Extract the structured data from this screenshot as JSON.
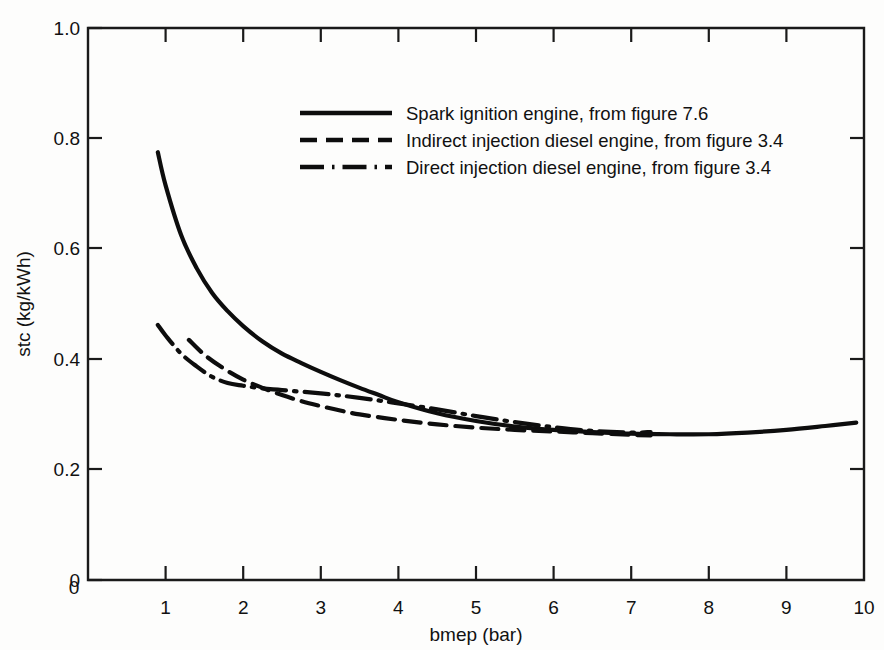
{
  "figure": {
    "background_color": "#fdfdfc",
    "line_color": "#0d0d0d"
  },
  "axes": {
    "x": {
      "label": "bmep (bar)",
      "ticks": [
        "0",
        "1",
        "2",
        "3",
        "4",
        "5",
        "6",
        "7",
        "8",
        "9",
        "10"
      ],
      "range": [
        0,
        10
      ]
    },
    "y": {
      "label": "stc (kg/kWh)",
      "ticks": [
        "0",
        "0.2",
        "0.4",
        "0.6",
        "0.8",
        "1.0"
      ],
      "range": [
        0,
        1.0
      ]
    }
  },
  "legend": {
    "entries": [
      {
        "label": "Spark ignition engine, from figure 7.6",
        "style": "solid"
      },
      {
        "label": "Indirect injection diesel engine, from figure 3.4",
        "style": "dashed"
      },
      {
        "label": "Direct injection diesel engine, from figure 3.4",
        "style": "dashdot"
      }
    ]
  },
  "chart_data": {
    "type": "line",
    "title": "",
    "xlabel": "bmep (bar)",
    "ylabel": "stc (kg/kWh)",
    "xlim": [
      0,
      10
    ],
    "ylim": [
      0,
      1.0
    ],
    "xticks": [
      0,
      1,
      2,
      3,
      4,
      5,
      6,
      7,
      8,
      9,
      10
    ],
    "yticks": [
      0,
      0.2,
      0.4,
      0.6,
      0.8,
      1.0
    ],
    "grid": false,
    "legend_position": "upper-center",
    "series": [
      {
        "name": "Spark ignition engine, from figure 7.6",
        "style": "solid",
        "x": [
          0.9,
          1.0,
          1.2,
          1.4,
          1.6,
          1.8,
          2.0,
          2.25,
          2.5,
          2.75,
          3.0,
          3.25,
          3.5,
          3.75,
          4.0,
          4.5,
          5.0,
          5.5,
          6.0,
          6.5,
          7.0,
          7.5,
          8.0,
          8.5,
          9.0,
          9.5,
          9.9
        ],
        "y": [
          0.775,
          0.715,
          0.625,
          0.565,
          0.52,
          0.487,
          0.46,
          0.432,
          0.41,
          0.393,
          0.377,
          0.362,
          0.348,
          0.335,
          0.322,
          0.302,
          0.288,
          0.278,
          0.272,
          0.268,
          0.265,
          0.264,
          0.264,
          0.267,
          0.272,
          0.279,
          0.285
        ]
      },
      {
        "name": "Indirect injection diesel engine, from figure 3.4",
        "style": "dashed",
        "x": [
          1.3,
          1.5,
          1.75,
          2.0,
          2.25,
          2.5,
          2.75,
          3.0,
          3.25,
          3.5,
          4.0,
          4.5,
          5.0,
          5.5,
          6.0,
          6.5,
          7.0,
          7.25
        ],
        "y": [
          0.435,
          0.408,
          0.383,
          0.363,
          0.348,
          0.335,
          0.324,
          0.315,
          0.307,
          0.3,
          0.29,
          0.282,
          0.276,
          0.272,
          0.269,
          0.266,
          0.263,
          0.262
        ]
      },
      {
        "name": "Direct injection diesel engine, from figure 3.4",
        "style": "dashdot",
        "x": [
          0.9,
          1.0,
          1.2,
          1.4,
          1.6,
          1.8,
          2.0,
          2.25,
          2.5,
          3.0,
          3.5,
          4.0,
          4.5,
          5.0,
          5.5,
          6.0,
          6.5,
          7.0,
          7.25
        ],
        "y": [
          0.462,
          0.443,
          0.41,
          0.387,
          0.368,
          0.357,
          0.352,
          0.347,
          0.344,
          0.338,
          0.33,
          0.32,
          0.309,
          0.297,
          0.286,
          0.277,
          0.27,
          0.267,
          0.268
        ]
      }
    ]
  }
}
